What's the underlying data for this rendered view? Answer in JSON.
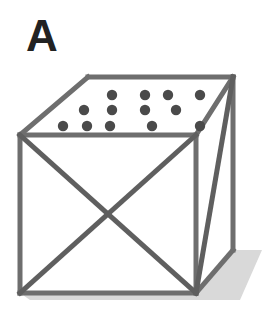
{
  "figure": {
    "panel_label": "A",
    "canvas": {
      "width": 273,
      "height": 320,
      "background": "#ffffff"
    },
    "colors": {
      "edge": "#6e6e6e",
      "edge_dark": "#5f5f5f",
      "dot": "#4a4a4a",
      "label": "#222222",
      "shadow": "#d9d9d9",
      "face_fill": "#ffffff"
    },
    "style": {
      "edge_width_px": 5,
      "dot_radius_px": 5.2
    },
    "geometry": {
      "front_face": {
        "name": "front-face-square-with-x-diagonals",
        "top_left": [
          20,
          135
        ],
        "top_right": [
          196,
          135
        ],
        "bottom_right": [
          196,
          293
        ],
        "bottom_left": [
          20,
          293
        ],
        "diagonals": [
          "top_left-to-bottom_right",
          "top_right-to-bottom_left"
        ]
      },
      "top_face": {
        "name": "top-face-parallelogram-dotted",
        "front_left": [
          20,
          135
        ],
        "rear_left": [
          88,
          77
        ],
        "rear_right": [
          233,
          77
        ],
        "front_right": [
          196,
          135
        ]
      },
      "right_face": {
        "name": "right-face-parallelogram-with-diagonal",
        "front_top": [
          196,
          135
        ],
        "rear_top": [
          233,
          77
        ],
        "rear_bottom": [
          233,
          250
        ],
        "front_bottom": [
          196,
          293
        ],
        "diagonal": "rear_top-to-front_bottom"
      },
      "shadow": {
        "name": "ground-shadow",
        "points": [
          [
            196,
            293
          ],
          [
            233,
            250
          ],
          [
            262,
            250
          ],
          [
            240,
            300
          ],
          [
            30,
            300
          ],
          [
            20,
            293
          ]
        ]
      }
    },
    "dots": {
      "count": 13,
      "rows": [
        {
          "y": 95,
          "x": [
            112,
            145,
            168,
            200
          ]
        },
        {
          "y": 110,
          "x": [
            84,
            112,
            145,
            176
          ]
        },
        {
          "y": 126,
          "x": [
            63,
            87,
            110,
            152,
            200
          ]
        }
      ]
    }
  }
}
